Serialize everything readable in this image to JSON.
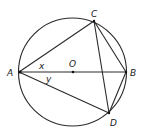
{
  "diagram": {
    "type": "circle-geometry",
    "circle": {
      "cx": 72.5,
      "cy": 72,
      "r": 54,
      "center_label": "O"
    },
    "points": {
      "A": {
        "label": "A",
        "x": 19,
        "y": 72
      },
      "B": {
        "label": "B",
        "x": 126,
        "y": 72
      },
      "C": {
        "label": "C",
        "x": 94,
        "y": 21
      },
      "D": {
        "label": "D",
        "x": 109,
        "y": 113
      },
      "O": {
        "label": "O",
        "x": 73,
        "y": 72
      }
    },
    "segments": [
      "AB",
      "AC",
      "AD",
      "CB",
      "CD",
      "BD"
    ],
    "angles": {
      "x": {
        "label": "x",
        "description": "angle CAB"
      },
      "y": {
        "label": "y",
        "description": "angle BAD"
      }
    },
    "colors": {
      "stroke": "#2a2a2a",
      "text": "#222222",
      "background": "#ffffff"
    }
  }
}
